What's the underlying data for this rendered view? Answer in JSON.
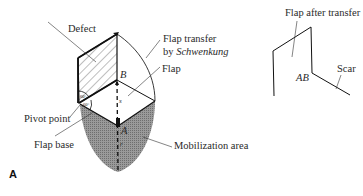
{
  "figure": {
    "panel_label": "A",
    "left_diagram": {
      "labels": {
        "defect": "Defect",
        "flap_transfer_line1": "Flap transfer",
        "flap_transfer_line2_prefix": "by ",
        "flap_transfer_line2_italic": "Schwenkung",
        "flap": "Flap",
        "pivot_point": "Pivot point",
        "flap_base": "Flap base",
        "mobilization_area": "Mobilization area",
        "point_b": "B",
        "point_a": "A",
        "segment_s": "s",
        "segment_r": "r",
        "angle_top": "60°",
        "angle_bottom": "60°"
      }
    },
    "right_diagram": {
      "labels": {
        "flap_after_transfer": "Flap after transfer",
        "ab": "AB",
        "scar": "Scar"
      }
    },
    "colors": {
      "line": "#111111",
      "label_text": "#2a2a2a",
      "shading": "#8a8a8a"
    }
  }
}
